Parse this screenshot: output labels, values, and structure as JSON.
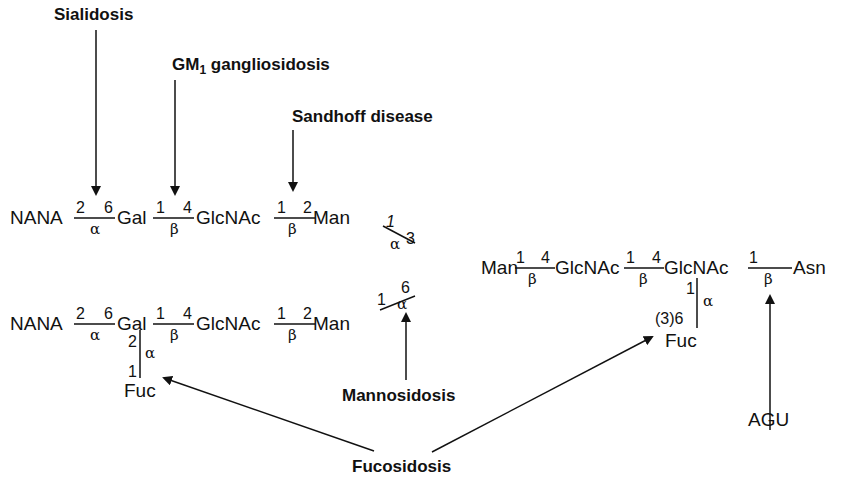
{
  "diseases": {
    "sialidosis": "Sialidosis",
    "gm1_prefix": "GM",
    "gm1_sub": "1",
    "gm1_suffix": " gangliosidosis",
    "sandhoff": "Sandhoff disease",
    "mannosidosis": "Mannosidosis",
    "fucosidosis": "Fucosidosis",
    "agu": "AGU"
  },
  "chain_upper": {
    "residues": [
      "NANA",
      "Gal",
      "GlcNAc",
      "Man"
    ],
    "links": [
      {
        "from": "2",
        "to": "6",
        "anomer": "α"
      },
      {
        "from": "1",
        "to": "4",
        "anomer": "β"
      },
      {
        "from": "1",
        "to": "2",
        "anomer": "β"
      }
    ]
  },
  "chain_lower": {
    "residues": [
      "NANA",
      "Gal",
      "GlcNAc",
      "Man"
    ],
    "links": [
      {
        "from": "2",
        "to": "6",
        "anomer": "α"
      },
      {
        "from": "1",
        "to": "4",
        "anomer": "β"
      },
      {
        "from": "1",
        "to": "2",
        "anomer": "β"
      }
    ],
    "branch": {
      "residue": "Fuc",
      "top": "2",
      "bottom": "1",
      "anomer": "α"
    }
  },
  "core_links": {
    "upper": {
      "from": "1",
      "to": "3",
      "anomer": "α"
    },
    "lower": {
      "from": "1",
      "to": "6",
      "anomer": "α"
    }
  },
  "core_chain": {
    "residues": [
      "Man",
      "GlcNAc",
      "GlcNAc",
      "Asn"
    ],
    "links": [
      {
        "from": "1",
        "to": "4",
        "anomer": "β"
      },
      {
        "from": "1",
        "to": "4",
        "anomer": "β"
      },
      {
        "from": "1",
        "to": "",
        "anomer": "β"
      }
    ],
    "branch": {
      "residue": "Fuc",
      "top": "1",
      "bottom": "(3)6",
      "anomer": "α"
    }
  }
}
